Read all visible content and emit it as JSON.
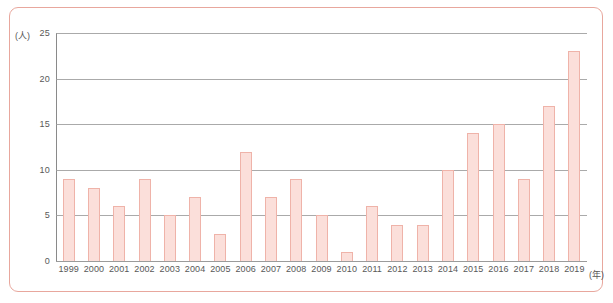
{
  "chart_data": {
    "type": "bar",
    "title": "",
    "xlabel": "(年)",
    "ylabel": "(人)",
    "ylim": [
      0,
      25
    ],
    "yticks": [
      0,
      5,
      10,
      15,
      20,
      25
    ],
    "grid": true,
    "legend": null,
    "categories": [
      "1999",
      "2000",
      "2001",
      "2002",
      "2003",
      "2004",
      "2005",
      "2006",
      "2007",
      "2008",
      "2009",
      "2010",
      "2011",
      "2012",
      "2013",
      "2014",
      "2015",
      "2016",
      "2017",
      "2018",
      "2019"
    ],
    "values": [
      9,
      8,
      6,
      9,
      5,
      7,
      3,
      12,
      7,
      9,
      5,
      1,
      6,
      4,
      4,
      10,
      14,
      15,
      9,
      17,
      23
    ],
    "colors": {
      "bar_fill": "#fbdfda",
      "bar_stroke": "#efb3a9",
      "frame_border": "#e8a79d",
      "gridline": "#9b9b9b",
      "axis": "#8a8a8a",
      "tick_text": "#585858",
      "background": "#ffffff"
    }
  }
}
